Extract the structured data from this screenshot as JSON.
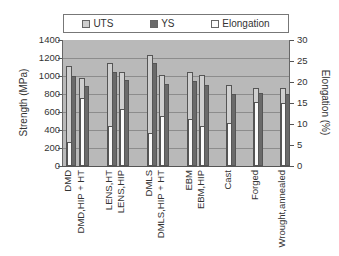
{
  "chart_data": {
    "type": "bar",
    "title": "",
    "legend": [
      "UTS",
      "YS",
      "Elongation"
    ],
    "legend_position": "top",
    "categories": [
      "DMD",
      "DMD,HIP + HT",
      "LENS,HT",
      "LENS,HIP",
      "DMLS",
      "DMLS,HIP + HT",
      "EBM",
      "EBM,HIP",
      "Cast",
      "Forged",
      "Wrought,annealed"
    ],
    "series": [
      {
        "name": "UTS",
        "axis": "left",
        "values": [
          1110,
          980,
          1150,
          1040,
          1230,
          1010,
          1040,
          1010,
          900,
          870,
          870
        ]
      },
      {
        "name": "YS",
        "axis": "left",
        "values": [
          1000,
          890,
          1050,
          960,
          1150,
          910,
          950,
          900,
          800,
          810,
          800
        ]
      },
      {
        "name": "Elongation",
        "axis": "right",
        "values": [
          5.7,
          16.2,
          9.5,
          13.6,
          7.9,
          11.9,
          11.2,
          9.5,
          10.2,
          15.2,
          15.0
        ]
      }
    ],
    "ylabel": "Strength (MPa)",
    "ylabel_right": "Elongation (%)",
    "xlabel": "",
    "ylim": [
      0,
      1400
    ],
    "ylim_right": [
      0,
      30
    ],
    "yticks": [
      0,
      200,
      400,
      600,
      800,
      1000,
      1200,
      1400
    ],
    "yticks_right": [
      0,
      5,
      10,
      15,
      20,
      25,
      30
    ],
    "grid": true,
    "colors": {
      "UTS": "#cfcfcf",
      "YS": "#6a6a6a",
      "Elongation": "#fbfbfb",
      "plot_bg": "#b9b9b9"
    }
  }
}
